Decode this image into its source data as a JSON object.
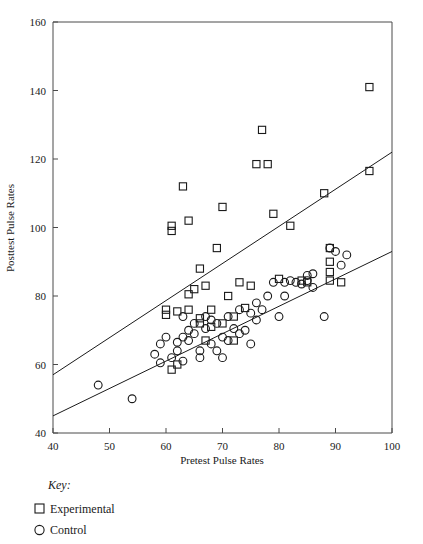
{
  "chart_data": {
    "type": "scatter",
    "title": "",
    "xlabel": "Pretest Pulse Rates",
    "ylabel": "Posttest Pulse Rates",
    "xlim": [
      40,
      100
    ],
    "ylim": [
      40,
      160
    ],
    "xticks": [
      40,
      50,
      60,
      70,
      80,
      90,
      100
    ],
    "yticks": [
      40,
      60,
      80,
      100,
      120,
      140,
      160
    ],
    "grid": false,
    "legend_position": "below-axes-left",
    "legend_title": "Key:",
    "series": [
      {
        "name": "Experimental",
        "marker": "square",
        "points": [
          [
            61,
            99.0
          ],
          [
            61,
            100.5
          ],
          [
            63,
            112.0
          ],
          [
            64,
            102.0
          ],
          [
            66,
            88.0
          ],
          [
            60,
            76.0
          ],
          [
            60,
            74.5
          ],
          [
            61,
            58.5
          ],
          [
            62,
            60.0
          ],
          [
            62,
            75.5
          ],
          [
            64,
            76.0
          ],
          [
            64,
            80.5
          ],
          [
            65,
            82.0
          ],
          [
            66,
            72.0
          ],
          [
            66,
            73.5
          ],
          [
            67,
            83.0
          ],
          [
            68,
            71.0
          ],
          [
            68,
            76.0
          ],
          [
            69,
            94.0
          ],
          [
            70,
            106.0
          ],
          [
            70,
            72.0
          ],
          [
            71,
            80.0
          ],
          [
            72,
            67.0
          ],
          [
            73,
            84.0
          ],
          [
            74,
            76.5
          ],
          [
            76,
            118.5
          ],
          [
            77,
            128.5
          ],
          [
            78,
            118.5
          ],
          [
            79,
            104.0
          ],
          [
            80,
            85.0
          ],
          [
            82,
            100.5
          ],
          [
            84,
            84.5
          ],
          [
            85,
            84.0
          ],
          [
            88,
            110.0
          ],
          [
            89,
            94.0
          ],
          [
            89,
            90.0
          ],
          [
            89,
            87.0
          ],
          [
            89,
            84.5
          ],
          [
            91,
            84.0
          ],
          [
            96,
            141.0
          ],
          [
            96,
            116.5
          ],
          [
            75,
            83.0
          ],
          [
            72,
            74.0
          ],
          [
            67,
            67.0
          ]
        ]
      },
      {
        "name": "Control",
        "marker": "circle",
        "points": [
          [
            48,
            54.0
          ],
          [
            54,
            50.0
          ],
          [
            58,
            63.0
          ],
          [
            59,
            60.5
          ],
          [
            59,
            66.0
          ],
          [
            60,
            68.0
          ],
          [
            61,
            62.0
          ],
          [
            62,
            64.0
          ],
          [
            62,
            66.5
          ],
          [
            63,
            68.0
          ],
          [
            63,
            61.0
          ],
          [
            64,
            70.0
          ],
          [
            64,
            67.0
          ],
          [
            65,
            72.0
          ],
          [
            65,
            69.0
          ],
          [
            66,
            64.0
          ],
          [
            66,
            62.0
          ],
          [
            67,
            70.5
          ],
          [
            68,
            73.0
          ],
          [
            68,
            66.0
          ],
          [
            69,
            72.0
          ],
          [
            70,
            62.0
          ],
          [
            70,
            68.0
          ],
          [
            71,
            74.0
          ],
          [
            71,
            67.0
          ],
          [
            72,
            70.5
          ],
          [
            73,
            76.0
          ],
          [
            73,
            69.0
          ],
          [
            74,
            70.0
          ],
          [
            75,
            75.0
          ],
          [
            76,
            78.0
          ],
          [
            76,
            73.0
          ],
          [
            77,
            76.0
          ],
          [
            78,
            80.0
          ],
          [
            79,
            84.0
          ],
          [
            80,
            74.0
          ],
          [
            81,
            84.0
          ],
          [
            82,
            84.5
          ],
          [
            83,
            84.0
          ],
          [
            84,
            83.5
          ],
          [
            85,
            84.5
          ],
          [
            86,
            82.5
          ],
          [
            88,
            74.0
          ],
          [
            89,
            94.0
          ],
          [
            90,
            93.0
          ],
          [
            91,
            89.0
          ],
          [
            92,
            92.0
          ],
          [
            85,
            86.0
          ],
          [
            86,
            86.5
          ],
          [
            81,
            80.0
          ],
          [
            75,
            66.0
          ],
          [
            69,
            64.0
          ],
          [
            67,
            74.0
          ],
          [
            63,
            74.0
          ]
        ]
      }
    ],
    "fit_lines": [
      {
        "name": "experimental-fit",
        "x": [
          40,
          100
        ],
        "y": [
          57.0,
          122.0
        ]
      },
      {
        "name": "control-fit",
        "x": [
          40,
          100
        ],
        "y": [
          45.0,
          93.0
        ]
      }
    ]
  },
  "axes": {
    "x_label": "Pretest Pulse Rates",
    "y_label": "Posttest Pulse Rates",
    "x_ticks": [
      "40",
      "50",
      "60",
      "70",
      "80",
      "90",
      "100"
    ],
    "y_ticks": [
      "40",
      "60",
      "80",
      "100",
      "120",
      "140",
      "160"
    ]
  },
  "key": {
    "title": "Key:",
    "entries": [
      {
        "label": "Experimental",
        "marker": "square"
      },
      {
        "label": "Control",
        "marker": "circle"
      }
    ]
  },
  "colors": {
    "marker": "#1a1a1a",
    "axis": "#4a4a4a",
    "background": "#ffffff"
  }
}
